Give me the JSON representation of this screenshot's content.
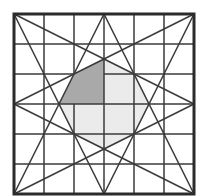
{
  "diagram": {
    "type": "geometric-figure",
    "frame": {
      "x": 14,
      "y": 14,
      "size": 180,
      "stroke": "#2b2b2b",
      "stroke_width": 3
    },
    "grid": {
      "divisions": 6,
      "cell": 30,
      "stroke": "#3a3a3a",
      "stroke_width": 1.5
    },
    "star_lines": [
      {
        "from": [
          14,
          14
        ],
        "to": [
          194,
          104
        ]
      },
      {
        "from": [
          14,
          14
        ],
        "to": [
          104,
          194
        ]
      },
      {
        "from": [
          194,
          14
        ],
        "to": [
          14,
          104
        ]
      },
      {
        "from": [
          194,
          14
        ],
        "to": [
          104,
          194
        ]
      },
      {
        "from": [
          14,
          194
        ],
        "to": [
          104,
          14
        ]
      },
      {
        "from": [
          14,
          194
        ],
        "to": [
          194,
          104
        ]
      },
      {
        "from": [
          194,
          194
        ],
        "to": [
          104,
          14
        ]
      },
      {
        "from": [
          194,
          194
        ],
        "to": [
          14,
          104
        ]
      }
    ],
    "octagon": {
      "points": [
        [
          104,
          59
        ],
        [
          134,
          74
        ],
        [
          149,
          104
        ],
        [
          134,
          134
        ],
        [
          104,
          149
        ],
        [
          74,
          134
        ],
        [
          59,
          104
        ],
        [
          74,
          74
        ]
      ],
      "fill": "#ebebeb",
      "stroke": "#9a9a9a"
    },
    "dark_region": {
      "points": [
        [
          104,
          59
        ],
        [
          74,
          74
        ],
        [
          59,
          104
        ],
        [
          104,
          104
        ]
      ],
      "fill": "#a9a9a9"
    },
    "colors": {
      "background": "#ffffff",
      "line": "#3a3a3a",
      "frame": "#2b2b2b",
      "light_fill": "#ebebeb",
      "dark_fill": "#a9a9a9"
    }
  }
}
